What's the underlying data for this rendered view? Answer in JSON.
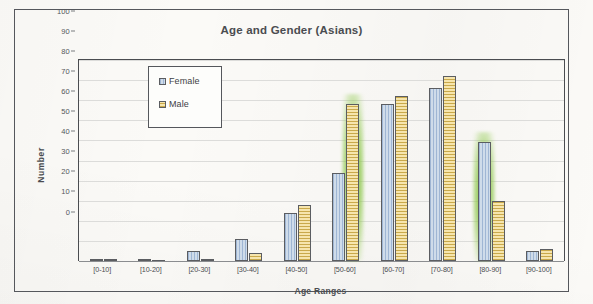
{
  "chart_data": {
    "type": "bar",
    "title": "Age and Gender (Asians)",
    "xlabel": "Age Ranges",
    "ylabel": "Number",
    "ylim": [
      0,
      100
    ],
    "ytick_step": 10,
    "yticks": [
      "100",
      "90",
      "80",
      "70",
      "60",
      "50",
      "40",
      "30",
      "20",
      "10",
      "0"
    ],
    "grid": true,
    "legend_position": "upper-left-inside",
    "categories": [
      "[0-10]",
      "[10-20]",
      "[20-30]",
      "[30-40]",
      "[40-50]",
      "[50-60]",
      "[60-70]",
      "[70-80]",
      "[80-90]",
      "[90-100]"
    ],
    "series": [
      {
        "name": "Female",
        "color": "#bccde3",
        "values": [
          1,
          1,
          5,
          11,
          24,
          44,
          78,
          86,
          59,
          5
        ]
      },
      {
        "name": "Male",
        "color": "#f0dca2",
        "values": [
          1,
          0,
          1,
          4,
          28,
          78,
          82,
          92,
          30,
          6
        ]
      }
    ],
    "annotations": [
      {
        "type": "highlighter",
        "color": "#7ebf3c",
        "category": "[50-60]",
        "series": "Male"
      },
      {
        "type": "highlighter",
        "color": "#7ebf3c",
        "category": "[80-90]",
        "series": "Female"
      }
    ]
  },
  "legend": {
    "items": [
      {
        "label": "Female",
        "swatch": "female"
      },
      {
        "label": "Male",
        "swatch": "male"
      }
    ]
  },
  "page": {
    "background_color": "#fbfaf7",
    "frame_color": "#55575c"
  }
}
